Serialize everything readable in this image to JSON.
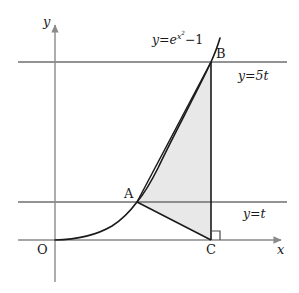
{
  "figure": {
    "kind": "cartesian-geometry-diagram",
    "background_color": "#ffffff",
    "ink_color": "#1a1a1a",
    "axis_color": "#8a8a8a",
    "shade_color": "#e8e8e8",
    "canvas": {
      "width": 299,
      "height": 293
    }
  },
  "axes": {
    "x_label": "x",
    "y_label": "y",
    "origin_label": "O",
    "x_axis_y": 240,
    "y_axis_x": 55,
    "x_axis_from": 18,
    "x_axis_to": 287,
    "y_axis_from": 282,
    "y_axis_to": 20
  },
  "curve": {
    "label": "y=e",
    "label_exponent": "x",
    "label_exponent2": "2",
    "label_tail": "−1",
    "equation_plain": "y = e^(x^2) - 1",
    "label_x": 152,
    "label_y": 31
  },
  "level_lines": [
    {
      "name": "upper-level-line",
      "label": "y=5t",
      "y": 62,
      "label_x": 238,
      "label_y": 70,
      "from_x": 18,
      "to_x": 287
    },
    {
      "name": "lower-level-line",
      "label": "y=t",
      "y": 202,
      "label_x": 243,
      "label_y": 208,
      "from_x": 18,
      "to_x": 287
    }
  ],
  "points": [
    {
      "id": "A",
      "label": "A",
      "x": 137,
      "y": 202,
      "label_x": 124,
      "label_y": 187
    },
    {
      "id": "B",
      "label": "B",
      "x": 211,
      "y": 62,
      "label_x": 216,
      "label_y": 47
    },
    {
      "id": "C",
      "label": "C",
      "x": 211,
      "y": 240,
      "label_x": 206,
      "label_y": 243
    }
  ],
  "right_angle": {
    "at_point": "C",
    "size": 9,
    "orientation": "up-right"
  },
  "shaded_region": {
    "description": "region bounded by segment A-C, segment C-B, and the curve from B back to A",
    "fill": "#e8e8e8",
    "stroke": "#1a1a1a"
  },
  "segments": [
    {
      "name": "segment-AB",
      "from": "A",
      "to": "B"
    },
    {
      "name": "segment-AC",
      "from": "A",
      "to": "C"
    },
    {
      "name": "segment-CB",
      "from": "C",
      "to": "B"
    }
  ]
}
